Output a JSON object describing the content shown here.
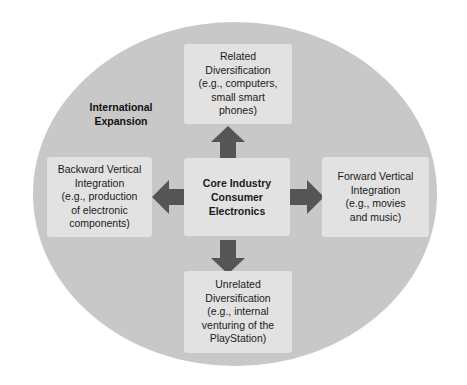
{
  "diagram": {
    "container_label": {
      "name": "international-expansion",
      "text": "International\nExpansion"
    },
    "colors": {
      "page_background": "#ffffff",
      "ellipse_fill": "#c8c8c8",
      "box_fill": "#e2e2e2",
      "arrow_fill": "#555555",
      "text": "#1a1a1a"
    },
    "nodes": {
      "core": {
        "id": "core-industry",
        "text": "Core Industry\nConsumer\nElectronics",
        "emphasis": "bold"
      },
      "top": {
        "id": "related-diversification",
        "text": "Related\nDiversification\n(e.g., computers,\nsmall smart\nphones)",
        "emphasis": "normal"
      },
      "bottom": {
        "id": "unrelated-diversification",
        "text": "Unrelated\nDiversification\n(e.g., internal\nventuring of the\nPlayStation)",
        "emphasis": "normal"
      },
      "left": {
        "id": "backward-vertical-integration",
        "text": "Backward Vertical\nIntegration\n(e.g., production\nof electronic\ncomponents)",
        "emphasis": "normal"
      },
      "right": {
        "id": "forward-vertical-integration",
        "text": "Forward Vertical\nIntegration\n(e.g., movies\nand music)",
        "emphasis": "normal"
      }
    },
    "arrows": [
      {
        "id": "arrow-up",
        "direction": "up",
        "from": "core-industry",
        "to": "related-diversification"
      },
      {
        "id": "arrow-down",
        "direction": "down",
        "from": "core-industry",
        "to": "unrelated-diversification"
      },
      {
        "id": "arrow-left",
        "direction": "left",
        "from": "core-industry",
        "to": "backward-vertical-integration"
      },
      {
        "id": "arrow-right",
        "direction": "right",
        "from": "core-industry",
        "to": "forward-vertical-integration"
      }
    ]
  }
}
